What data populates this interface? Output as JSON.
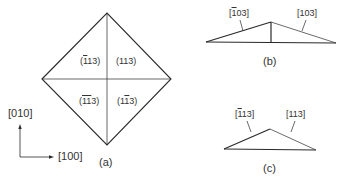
{
  "panel_a": {
    "caption": "(a)",
    "planes": {
      "top_left": {
        "pre": "(",
        "bar": "1",
        "rest": "13)"
      },
      "top_right": {
        "text": "(113)"
      },
      "bottom_left": {
        "pre": "(",
        "bar": "11",
        "rest": "3)"
      },
      "bottom_right": {
        "pre": "(1",
        "bar": "1",
        "rest": "3)"
      }
    },
    "axes": {
      "vertical": "[010]",
      "horizontal": "[100]"
    }
  },
  "panel_b": {
    "caption": "(b)",
    "left_direction": {
      "pre": "[",
      "bar": "1",
      "rest": "03]"
    },
    "right_direction": {
      "text": "[103]"
    }
  },
  "panel_c": {
    "caption": "(c)",
    "left_direction": {
      "pre": "[",
      "bar": "1",
      "rest": "13]"
    },
    "right_direction": {
      "text": "[113]"
    }
  },
  "colors": {
    "line": "#2a2a2a",
    "text": "#333333"
  }
}
